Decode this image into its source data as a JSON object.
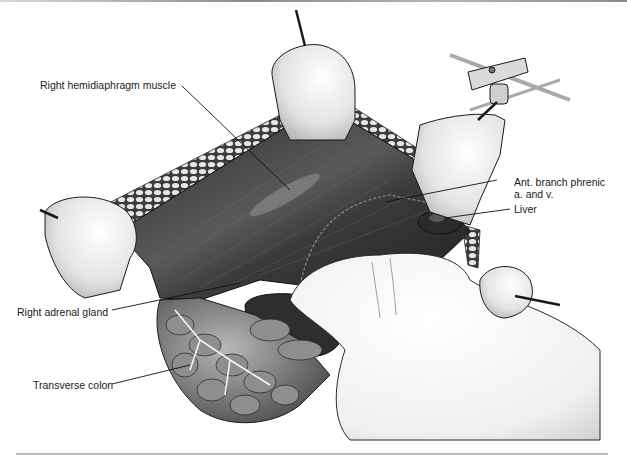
{
  "figure": {
    "labels": [
      {
        "id": "hemidiaphragm",
        "text": "Right hemidiaphragm muscle"
      },
      {
        "id": "phrenic",
        "line1": "Ant. branch phrenic",
        "line2": "a. and v."
      },
      {
        "id": "liver",
        "text": "Liver"
      },
      {
        "id": "adrenal",
        "text": "Right adrenal gland"
      },
      {
        "id": "colon",
        "text": "Transverse colon"
      }
    ]
  },
  "colors": {
    "background": "#ffffff",
    "muscle_dark": "#3a3a3a",
    "fat": "#d8d8d8",
    "retractor": "#e8e8e8",
    "glove": "#f2f2f2",
    "leader": "#111111"
  }
}
